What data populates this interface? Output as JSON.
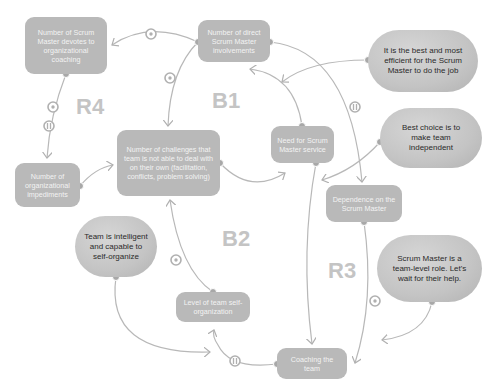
{
  "loops": [
    {
      "id": "R4",
      "label": "R4"
    },
    {
      "id": "B1",
      "label": "B1"
    },
    {
      "id": "B2",
      "label": "B2"
    },
    {
      "id": "R3",
      "label": "R3"
    }
  ],
  "variables": {
    "org_coaching": "Number of Scrum Master devotes to organizational coaching",
    "direct_involvements": "Number of direct Scrum Master involvements",
    "challenges": "Number of challenges that team is not able to deal with on their own (facilitation, conflicts, problem solving)",
    "need_service": "Need for Scrum Master service",
    "org_impediments": "Number of organizational impediments",
    "dependence": "Dependence on the Scrum Master",
    "self_organization": "Level of team self-organization",
    "coaching": "Coaching the team"
  },
  "beliefs": {
    "best_efficient": "It is the best and most efficient for the Scrum Master to do the job",
    "make_independent": "Best choice is to make team independent",
    "team_intelligent": "Team is intelligent and capable to self-organize",
    "team_level_role": "Scrum Master is a team-level role. Let's wait for their help."
  },
  "link_markers": {
    "opposite": "o",
    "delay": "II"
  },
  "colors": {
    "variable_fill": "#b9b9b9",
    "belief_fill": "#c8c8c8",
    "link": "#b0b0b0",
    "loop_label": "#c4c4c4"
  }
}
